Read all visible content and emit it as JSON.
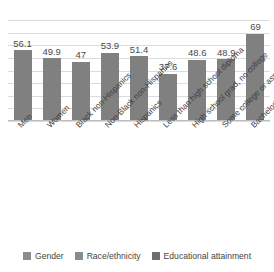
{
  "chart_data": {
    "type": "bar",
    "title": "",
    "subtitle": "",
    "xlabel": "",
    "ylabel": "",
    "ylim": [
      0,
      80
    ],
    "grid": true,
    "grid_values": [
      0,
      10,
      20,
      30,
      40,
      50,
      60,
      70,
      80
    ],
    "legend_position": "bottom",
    "categories": [
      "Men",
      "Women",
      "Black non-Hispanics",
      "Non-Black non-Hispanics",
      "Hispanics",
      "Less than high school diploma",
      "High school grad, no college",
      "Some college or associate's...",
      "Bachelor's degree or higher"
    ],
    "values": [
      56.1,
      49.9,
      47,
      53.9,
      51.4,
      37.6,
      48.6,
      48.9,
      69
    ],
    "value_labels": [
      "56.1",
      "49.9",
      "47",
      "53.9",
      "51.4",
      "37.6",
      "48.6",
      "48.9",
      "69"
    ],
    "group_of_category": [
      "Gender",
      "Gender",
      "Race/ethnicity",
      "Race/ethnicity",
      "Race/ethnicity",
      "Educational attainment",
      "Educational attainment",
      "Educational attainment",
      "Educational attainment"
    ],
    "bar_color": "#808080",
    "gridline_color": "#dcdcdc",
    "background_color": "#ffffff"
  },
  "legend": {
    "items": [
      {
        "label": "Gender",
        "color": "#8c8c8c"
      },
      {
        "label": "Race/ethnicity",
        "color": "#8c8c8c"
      },
      {
        "label": "Educational attainment",
        "color": "#6e6e6e"
      }
    ]
  }
}
